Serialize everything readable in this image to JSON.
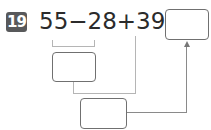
{
  "problem": {
    "number": "19",
    "expression": "55−28+39=",
    "operands": [
      "55",
      "28",
      "39"
    ],
    "operators": [
      "−",
      "+"
    ],
    "answer_box": "",
    "step1_box": "",
    "step2_box": ""
  }
}
